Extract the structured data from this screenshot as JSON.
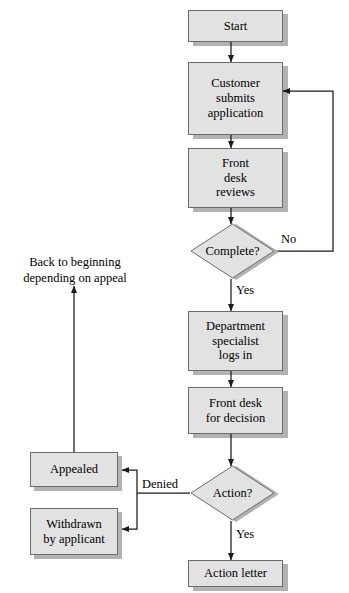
{
  "diagram": {
    "palette": {
      "node_fill": "#e2e2e2",
      "node_border": "#6b6b6b",
      "shadow": "#b2b2b2",
      "line": "#1a1a1a",
      "background": "#ffffff"
    },
    "nodes": [
      {
        "id": "start",
        "label": "Start",
        "shape": "process"
      },
      {
        "id": "customer",
        "label": "Customer submits application",
        "shape": "process"
      },
      {
        "id": "frontdesk",
        "label": "Front desk reviews",
        "shape": "process"
      },
      {
        "id": "complete",
        "label": "Complete?",
        "shape": "decision"
      },
      {
        "id": "specialist",
        "label": "Department specialist logs in",
        "shape": "process"
      },
      {
        "id": "decision",
        "label": "Front desk for decision",
        "shape": "process"
      },
      {
        "id": "action",
        "label": "Action?",
        "shape": "decision"
      },
      {
        "id": "letter",
        "label": "Action letter",
        "shape": "process"
      },
      {
        "id": "appealed",
        "label": "Appealed",
        "shape": "process"
      },
      {
        "id": "withdrawn",
        "label": "Withdrawn by applicant",
        "shape": "process"
      }
    ],
    "node_lines": {
      "start": [
        "Start"
      ],
      "customer": [
        "Customer",
        "submits",
        "application"
      ],
      "frontdesk": [
        "Front",
        "desk",
        "reviews"
      ],
      "specialist": [
        "Department",
        "specialist",
        "logs in"
      ],
      "decision": [
        "Front desk",
        "for decision"
      ],
      "letter": [
        "Action letter"
      ],
      "appealed": [
        "Appealed"
      ],
      "withdrawn": [
        "Withdrawn",
        "by applicant"
      ]
    },
    "decision_labels": {
      "complete": "Complete?",
      "action": "Action?"
    },
    "edge_labels": {
      "complete_no": "No",
      "complete_yes": "Yes",
      "action_denied": "Denied",
      "action_yes": "Yes"
    },
    "notes": {
      "back_to_beginning_line1": "Back to beginning",
      "back_to_beginning_line2": "depending on appeal"
    }
  }
}
